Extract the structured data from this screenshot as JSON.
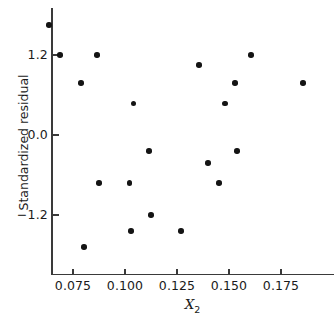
{
  "chart_data": {
    "type": "scatter",
    "title": "",
    "xlabel": "X2",
    "xlabel_display": "X",
    "xlabel_sub": "2",
    "ylabel": "Standardized residual",
    "xticks": [
      0.075,
      0.1,
      0.125,
      0.15,
      0.175
    ],
    "xtick_labels": [
      "0.075",
      "0.100",
      "0.125",
      "0.150",
      "0.175"
    ],
    "yticks": [
      1.2,
      0.0,
      -1.2
    ],
    "ytick_labels": [
      "1.2",
      "0.0",
      "−1.2"
    ],
    "xlim": [
      0.0625,
      0.1885
    ],
    "ylim": [
      -2.0,
      1.95
    ],
    "grid": false,
    "legend": null,
    "marker": "filled-circle",
    "marker_color": "#141414",
    "axis_color": "#3a3a3a",
    "background": "#ffffff",
    "points": [
      {
        "x": 0.0635,
        "y": 1.65
      },
      {
        "x": 0.0688,
        "y": 1.2
      },
      {
        "x": 0.0789,
        "y": 0.78
      },
      {
        "x": 0.0803,
        "y": -1.68
      },
      {
        "x": 0.0865,
        "y": 1.2
      },
      {
        "x": 0.0875,
        "y": -0.72
      },
      {
        "x": 0.1022,
        "y": -0.72
      },
      {
        "x": 0.1029,
        "y": -1.44
      },
      {
        "x": 0.1041,
        "y": 0.47
      },
      {
        "x": 0.1115,
        "y": -0.24
      },
      {
        "x": 0.1125,
        "y": -1.2
      },
      {
        "x": 0.1269,
        "y": -1.44
      },
      {
        "x": 0.1356,
        "y": 1.05
      },
      {
        "x": 0.1399,
        "y": -0.42
      },
      {
        "x": 0.1452,
        "y": -0.72
      },
      {
        "x": 0.1481,
        "y": 0.47
      },
      {
        "x": 0.1529,
        "y": 0.78
      },
      {
        "x": 0.1538,
        "y": -0.24
      },
      {
        "x": 0.1606,
        "y": 1.2
      },
      {
        "x": 0.1856,
        "y": 0.78
      }
    ]
  }
}
